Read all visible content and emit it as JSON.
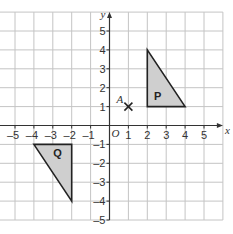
{
  "diagram": {
    "type": "coordinate-grid",
    "x_axis_label": "x",
    "y_axis_label": "y",
    "origin_label": "O",
    "x_range": [
      -5,
      5
    ],
    "y_range": [
      -5,
      5
    ],
    "x_ticks": [
      "-5",
      "-4",
      "-3",
      "-2",
      "-1",
      "1",
      "2",
      "3",
      "4",
      "5"
    ],
    "y_ticks": [
      "5",
      "4",
      "3",
      "2",
      "1",
      "-1",
      "-2",
      "-3",
      "-4",
      "-5"
    ],
    "point": {
      "label": "A",
      "x": 1,
      "y": 1,
      "marker": "cross"
    },
    "shapes": [
      {
        "label": "P",
        "vertices": [
          [
            2,
            1
          ],
          [
            2,
            4
          ],
          [
            4,
            1
          ]
        ],
        "fill": "#cfcfcf"
      },
      {
        "label": "Q",
        "vertices": [
          [
            -4,
            -1
          ],
          [
            -2,
            -1
          ],
          [
            -2,
            -4
          ]
        ],
        "fill": "#cfcfcf"
      }
    ]
  }
}
